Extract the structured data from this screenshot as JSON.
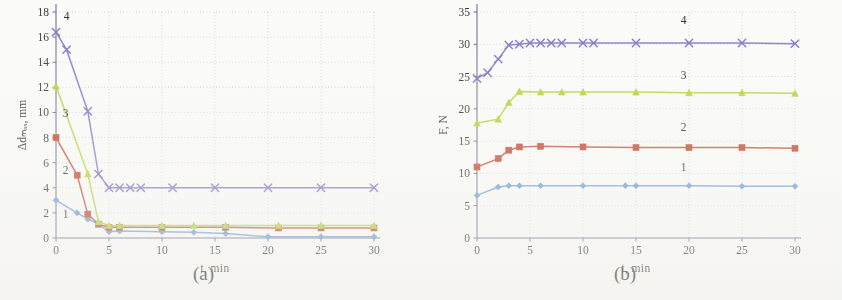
{
  "figure": {
    "panels": [
      {
        "caption": "(a)"
      },
      {
        "caption": "(b)"
      }
    ]
  },
  "chart_data": [
    {
      "type": "line",
      "panel_label": "(a)",
      "title": "",
      "xlabel": "t, min",
      "ylabel": "Δdₘₐₓ, mm",
      "xlim": [
        0,
        30
      ],
      "ylim": [
        0,
        18
      ],
      "xticks": [
        0,
        5,
        10,
        15,
        20,
        25,
        30
      ],
      "yticks": [
        0,
        2,
        4,
        6,
        8,
        10,
        12,
        14,
        16,
        18
      ],
      "grid": true,
      "legend_position": "inline-annotations",
      "series": [
        {
          "name": "1",
          "color": "#6a9bd8",
          "marker": "diamond",
          "x": [
            0,
            2,
            3,
            4,
            5,
            6,
            10,
            13,
            16,
            20,
            25,
            30
          ],
          "y": [
            3.0,
            2.0,
            1.5,
            1.1,
            0.5,
            0.55,
            0.5,
            0.45,
            0.35,
            0.1,
            0.1,
            0.1
          ]
        },
        {
          "name": "2",
          "color": "#c4462f",
          "marker": "square",
          "x": [
            0,
            2,
            3,
            4,
            5,
            6,
            10,
            16,
            21,
            25,
            30
          ],
          "y": [
            8.0,
            5.0,
            1.9,
            1.1,
            0.85,
            0.85,
            0.85,
            0.85,
            0.8,
            0.8,
            0.8
          ]
        },
        {
          "name": "3",
          "color": "#b3d334",
          "marker": "triangle",
          "x": [
            0,
            3,
            4,
            5,
            6,
            10,
            13,
            16,
            21,
            25,
            30
          ],
          "y": [
            12.1,
            5.1,
            1.3,
            1.0,
            1.0,
            1.0,
            1.0,
            1.0,
            1.0,
            1.0,
            1.0
          ]
        },
        {
          "name": "4",
          "color": "#8070c8",
          "marker": "cross",
          "x": [
            0,
            1,
            3,
            4,
            5,
            6,
            7,
            8,
            11,
            15,
            20,
            25,
            30
          ],
          "y": [
            16.4,
            15.0,
            10.1,
            5.1,
            4.0,
            4.0,
            4.0,
            4.0,
            4.0,
            4.0,
            4.0,
            4.0,
            4.0
          ]
        }
      ],
      "annotations": [
        {
          "text": "1",
          "x": 0.9,
          "y": 1.6
        },
        {
          "text": "2",
          "x": 0.9,
          "y": 5.1
        },
        {
          "text": "3",
          "x": 0.9,
          "y": 9.6
        },
        {
          "text": "4",
          "x": 1.0,
          "y": 17.4
        }
      ]
    },
    {
      "type": "line",
      "panel_label": "(b)",
      "title": "",
      "xlabel": "t, min",
      "ylabel": "F, N",
      "xlim": [
        0,
        30
      ],
      "ylim": [
        0,
        35
      ],
      "xticks": [
        0,
        5,
        10,
        15,
        20,
        25,
        30
      ],
      "yticks": [
        0,
        5,
        10,
        15,
        20,
        25,
        30,
        35
      ],
      "grid": true,
      "legend_position": "inline-annotations",
      "series": [
        {
          "name": "1",
          "color": "#6a9bd8",
          "marker": "diamond",
          "x": [
            0,
            2,
            3,
            4,
            6,
            10,
            14,
            15,
            20,
            25,
            30
          ],
          "y": [
            6.6,
            7.9,
            8.1,
            8.1,
            8.1,
            8.1,
            8.1,
            8.1,
            8.1,
            8.0,
            8.0
          ]
        },
        {
          "name": "2",
          "color": "#c4462f",
          "marker": "square",
          "x": [
            0,
            2,
            3,
            4,
            6,
            10,
            15,
            20,
            25,
            30
          ],
          "y": [
            11.0,
            12.3,
            13.6,
            14.1,
            14.2,
            14.1,
            14.0,
            14.0,
            14.0,
            13.9
          ]
        },
        {
          "name": "3",
          "color": "#b3d334",
          "marker": "triangle",
          "x": [
            0,
            2,
            3,
            4,
            6,
            8,
            10,
            15,
            20,
            25,
            30
          ],
          "y": [
            17.8,
            18.4,
            21.0,
            22.7,
            22.6,
            22.6,
            22.6,
            22.6,
            22.5,
            22.5,
            22.4
          ]
        },
        {
          "name": "4",
          "color": "#8070c8",
          "marker": "cross",
          "x": [
            0,
            1,
            2,
            3,
            4,
            5,
            6,
            7,
            8,
            10,
            11,
            15,
            20,
            25,
            30
          ],
          "y": [
            24.7,
            25.6,
            27.7,
            29.9,
            30.0,
            30.2,
            30.2,
            30.2,
            30.2,
            30.2,
            30.2,
            30.2,
            30.2,
            30.2,
            30.1
          ]
        }
      ],
      "annotations": [
        {
          "text": "1",
          "x": 19.5,
          "y": 10.3
        },
        {
          "text": "2",
          "x": 19.5,
          "y": 16.6
        },
        {
          "text": "3",
          "x": 19.5,
          "y": 24.7
        },
        {
          "text": "4",
          "x": 19.5,
          "y": 33.2
        }
      ]
    }
  ]
}
